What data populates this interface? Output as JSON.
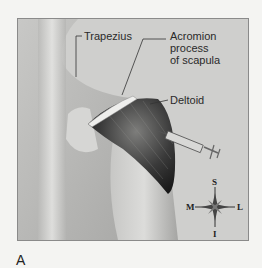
{
  "figure": {
    "panel_letter": "A",
    "labels": {
      "trapezius": "Trapezius",
      "acromion": "Acromion\nprocess\nof scapula",
      "deltoid": "Deltoid"
    },
    "compass": {
      "superior": "S",
      "inferior": "I",
      "medial": "M",
      "lateral": "L"
    },
    "colors": {
      "background": "#cfcfcd",
      "skin_light": "#e4e4e2",
      "muscle_dark": "#2b2b2b",
      "border": "#8a8a8a"
    }
  }
}
